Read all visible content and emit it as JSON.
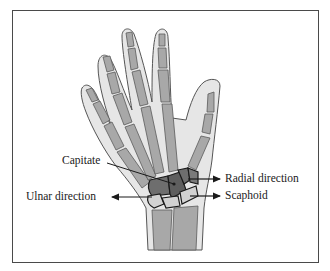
{
  "figure": {
    "type": "anatomical-diagram"
  },
  "labels": {
    "capitate": "Capitate",
    "ulnar_direction": "Ulnar direction",
    "radial_direction": "Radial direction",
    "scaphoid": "Scaphoid"
  },
  "colors": {
    "frame": "#4a4a4a",
    "skin_fill": "#e6e6e6",
    "skin_outline": "#555555",
    "bone_fill": "#a8a8a8",
    "bone_outline": "#5a5a5a",
    "carpal_dark": "#6e6e6e",
    "carpal_light": "#d2d2d2",
    "arrow": "#1a1a1a"
  }
}
